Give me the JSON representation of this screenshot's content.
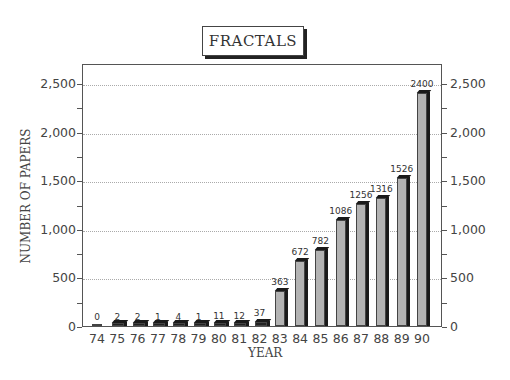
{
  "title": "FRACTALS",
  "chart_data": {
    "type": "bar",
    "title": "FRACTALS",
    "xlabel": "YEAR",
    "ylabel": "NUMBER OF PAPERS",
    "categories": [
      "74",
      "75",
      "76",
      "77",
      "78",
      "79",
      "80",
      "81",
      "82",
      "83",
      "84",
      "85",
      "86",
      "87",
      "88",
      "89",
      "90"
    ],
    "values": [
      0,
      2,
      2,
      1,
      4,
      1,
      11,
      12,
      37,
      363,
      672,
      782,
      1086,
      1256,
      1316,
      1526,
      2400
    ],
    "data_labels": [
      "0",
      "2",
      "2",
      "1",
      "4",
      "1",
      "11",
      "12",
      "37",
      "363",
      "672",
      "782",
      "1086",
      "1256",
      "1316",
      "1526",
      "2400"
    ],
    "ylim": [
      0,
      2700
    ],
    "yticks": [
      0,
      500,
      1000,
      1500,
      2000,
      2500
    ],
    "ytick_labels": [
      "0",
      "500",
      "1,000",
      "1,500",
      "2,000",
      "2,500"
    ],
    "grid": "horizontal dotted at major ticks",
    "dual_y_axis": true,
    "legend": null
  }
}
